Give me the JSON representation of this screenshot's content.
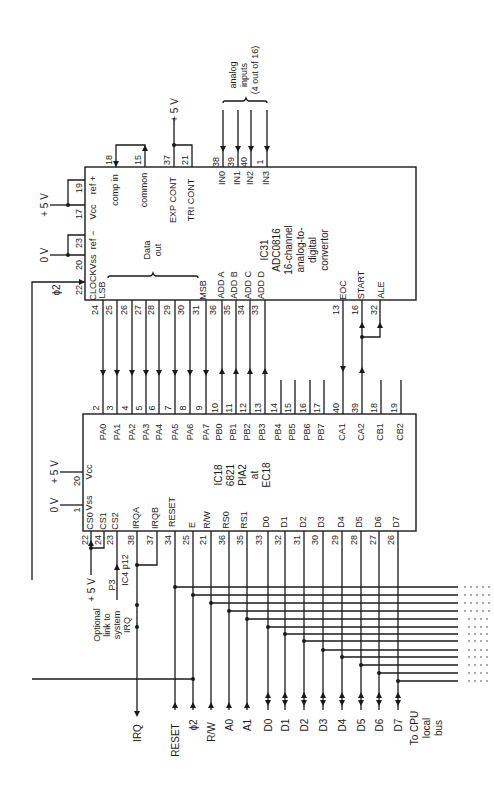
{
  "figure": {
    "orientation": "rotated 90° counter-clockwise",
    "adc": {
      "name": "IC31",
      "part": "ADC0816",
      "desc1": "16-channel",
      "desc2": "analog-to-",
      "desc3": "digital",
      "desc4": "convertor",
      "top_pins": [
        {
          "pin": "19",
          "label": "ref +"
        },
        {
          "pin": "17",
          "label": "Vcc"
        },
        {
          "pin": "23",
          "label": "ref −"
        },
        {
          "pin": "20",
          "label": "Vss"
        },
        {
          "pin": "22",
          "label": "CLOCK"
        }
      ],
      "right_pins": [
        {
          "pin": "18",
          "label": "comp in"
        },
        {
          "pin": "15",
          "label": "common"
        },
        {
          "pin": "37",
          "label": "EXP CONT"
        },
        {
          "pin": "21",
          "label": "TRI CONT"
        },
        {
          "pin": "38",
          "label": "IN0"
        },
        {
          "pin": "39",
          "label": "IN1"
        },
        {
          "pin": "40",
          "label": "IN2"
        },
        {
          "pin": "1",
          "label": "IN3"
        }
      ],
      "bottom_pins": [
        {
          "pin": "24",
          "label": "LSB"
        },
        {
          "pin": "25",
          "label": ""
        },
        {
          "pin": "26",
          "label": ""
        },
        {
          "pin": "27",
          "label": ""
        },
        {
          "pin": "28",
          "label": ""
        },
        {
          "pin": "29",
          "label": ""
        },
        {
          "pin": "30",
          "label": ""
        },
        {
          "pin": "31",
          "label": "MSB"
        },
        {
          "pin": "36",
          "label": "ADD A"
        },
        {
          "pin": "35",
          "label": "ADD B"
        },
        {
          "pin": "34",
          "label": "ADD C"
        },
        {
          "pin": "33",
          "label": "ADD D"
        },
        {
          "pin": "13",
          "label": "EOC"
        },
        {
          "pin": "16",
          "label": "START"
        },
        {
          "pin": "32",
          "label": "ALE"
        }
      ],
      "data_out_label_1": "Data",
      "data_out_label_2": "out",
      "plus5v": "+ 5 V",
      "zero_v": "0 V",
      "exp_plus5v": "+ 5 V",
      "phi2": "ϕ2"
    },
    "analog_inputs": {
      "line1": "analog",
      "line2": "inputs",
      "line3": "(4 out of 16)"
    },
    "pia": {
      "name": "IC18",
      "part": "6821",
      "role": "PIA2",
      "at": "at",
      "location": "EC18",
      "top_pins": [
        {
          "pin": "2",
          "label": "PA0"
        },
        {
          "pin": "3",
          "label": "PA1"
        },
        {
          "pin": "4",
          "label": "PA2"
        },
        {
          "pin": "5",
          "label": "PA3"
        },
        {
          "pin": "6",
          "label": "PA4"
        },
        {
          "pin": "7",
          "label": "PA5"
        },
        {
          "pin": "8",
          "label": "PA6"
        },
        {
          "pin": "9",
          "label": "PA7"
        },
        {
          "pin": "10",
          "label": "PB0"
        },
        {
          "pin": "11",
          "label": "PB1"
        },
        {
          "pin": "12",
          "label": "PB2"
        },
        {
          "pin": "13",
          "label": "PB3"
        },
        {
          "pin": "14",
          "label": "PB4"
        },
        {
          "pin": "15",
          "label": "PB5"
        },
        {
          "pin": "16",
          "label": "PB6"
        },
        {
          "pin": "17",
          "label": "PB7"
        },
        {
          "pin": "40",
          "label": "CA1"
        },
        {
          "pin": "39",
          "label": "CA2"
        },
        {
          "pin": "18",
          "label": "CB1"
        },
        {
          "pin": "19",
          "label": "CB2"
        }
      ],
      "left_pins": [
        {
          "pin": "20",
          "label": "Vcc"
        },
        {
          "pin": "1",
          "label": "Vss"
        }
      ],
      "bottom_pins": [
        {
          "pin": "22",
          "label": "CS0"
        },
        {
          "pin": "24",
          "label": "CS1"
        },
        {
          "pin": "23",
          "label": "CS2"
        },
        {
          "pin": "38",
          "label": "IRQA"
        },
        {
          "pin": "37",
          "label": "IRQB"
        },
        {
          "pin": "34",
          "label": "RESET"
        },
        {
          "pin": "25",
          "label": "E"
        },
        {
          "pin": "21",
          "label": "R/W"
        },
        {
          "pin": "36",
          "label": "RS0"
        },
        {
          "pin": "35",
          "label": "RS1"
        },
        {
          "pin": "33",
          "label": "D0"
        },
        {
          "pin": "32",
          "label": "D1"
        },
        {
          "pin": "31",
          "label": "D2"
        },
        {
          "pin": "30",
          "label": "D3"
        },
        {
          "pin": "29",
          "label": "D4"
        },
        {
          "pin": "28",
          "label": "D5"
        },
        {
          "pin": "27",
          "label": "D6"
        },
        {
          "pin": "26",
          "label": "D7"
        }
      ],
      "plus5v": "+ 5 V",
      "zero_v": "0 V",
      "cs_plus5v": "+ 5 V",
      "p3": "P3",
      "ic4": "IC4 p12",
      "optional_1": "Optional",
      "optional_2": "link to",
      "optional_3": "system",
      "optional_4": "IRQ"
    },
    "bus": {
      "signals": [
        "IRQ",
        "RESET",
        "ϕ2",
        "R/W",
        "A0",
        "A1",
        "D0",
        "D1",
        "D2",
        "D3",
        "D4",
        "D5",
        "D6",
        "D7"
      ],
      "to_cpu_1": "To CPU",
      "to_cpu_2": "local",
      "to_cpu_3": "bus"
    }
  }
}
